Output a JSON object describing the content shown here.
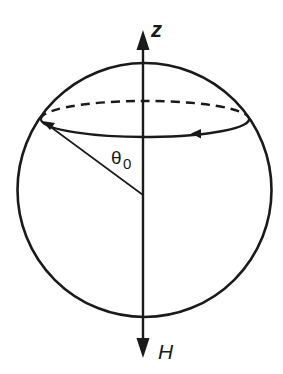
{
  "diagram": {
    "title": "",
    "labels": {
      "z_axis": "z",
      "field": "H",
      "angle_symbol": "θ",
      "angle_subscript": "0"
    },
    "elements": {
      "sphere": {
        "cx": 144,
        "cy": 190,
        "r": 127
      },
      "axis": {
        "x": 143,
        "y_top": 22,
        "y_bottom": 362
      },
      "precession_circle": {
        "cx": 145,
        "cy": 119,
        "rx": 104,
        "ry": 18,
        "back_half_style": "dashed",
        "front_half_style": "solid",
        "direction_arrow": "leftward on front"
      },
      "radius_vector": {
        "from": [
          143,
          195
        ],
        "to": [
          41,
          121
        ]
      }
    },
    "colors": {
      "stroke": "#1a1a1a",
      "background": "#ffffff"
    }
  }
}
